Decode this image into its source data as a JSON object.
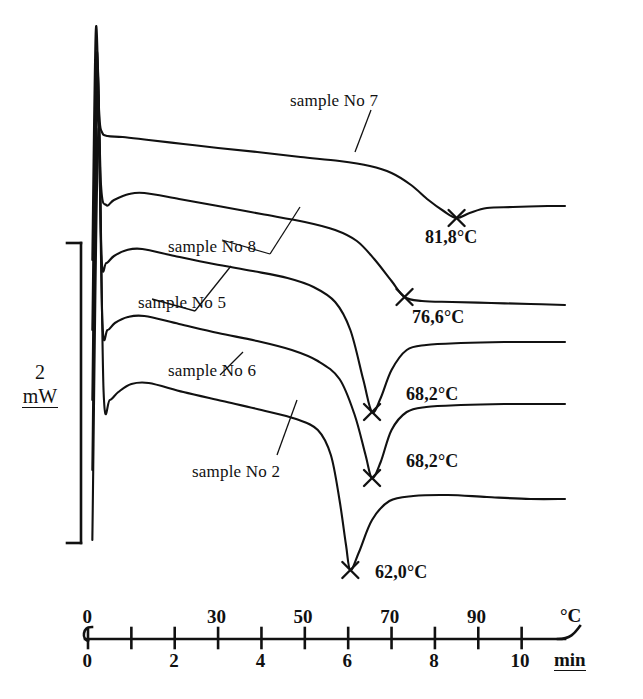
{
  "figure": {
    "type": "dsc-thermogram",
    "background_color": "#ffffff",
    "ink_color": "#111111"
  },
  "scale_bar": {
    "value": "2",
    "unit": "mW",
    "name": "2 mW vertical scale bar"
  },
  "axes": {
    "temperature_axis": {
      "unit_label": "°C",
      "tick_labels": [
        "0",
        "30",
        "50",
        "70",
        "90"
      ],
      "tick_values": [
        0,
        30,
        50,
        70,
        90
      ],
      "all_tick_values": [
        0,
        10,
        20,
        30,
        40,
        50,
        60,
        70,
        80,
        90,
        100
      ],
      "range": [
        0,
        100
      ]
    },
    "time_axis": {
      "unit_label": "min",
      "tick_labels": [
        "0",
        "2",
        "4",
        "6",
        "8",
        "10"
      ],
      "tick_values": [
        0,
        2,
        4,
        6,
        8,
        10
      ],
      "all_tick_values": [
        0,
        1,
        2,
        3,
        4,
        5,
        6,
        7,
        8,
        9,
        10
      ],
      "range": [
        0,
        11
      ]
    }
  },
  "curve_labels": [
    {
      "text": "sample No 7",
      "name": "curve-label-sample-no-7"
    },
    {
      "text": "sample No 8",
      "name": "curve-label-sample-no-8"
    },
    {
      "text": "sample No 5",
      "name": "curve-label-sample-no-5"
    },
    {
      "text": "sample No 6",
      "name": "curve-label-sample-no-6"
    },
    {
      "text": "sample No 2",
      "name": "curve-label-sample-no-2"
    }
  ],
  "peak_labels": [
    {
      "text": "81,8°C",
      "name": "peak-label-81-8"
    },
    {
      "text": "76,6°C",
      "name": "peak-label-76-6"
    },
    {
      "text": "68,2°C",
      "name": "peak-label-68-2-upper"
    },
    {
      "text": "68,2°C",
      "name": "peak-label-68-2-lower"
    },
    {
      "text": "62,0°C",
      "name": "peak-label-62-0"
    }
  ],
  "chart_data": {
    "type": "line",
    "title": "",
    "xlabel": "min",
    "ylabel": "mW",
    "x_secondary_label": "°C",
    "xlim": [
      0,
      11
    ],
    "x_temperature_lim": [
      0,
      100
    ],
    "grid": false,
    "legend": "inline-annotations",
    "scale_bar_mW": 2,
    "x_ticks_min": [
      0,
      1,
      2,
      3,
      4,
      5,
      6,
      7,
      8,
      9,
      10
    ],
    "x_ticklabels_min": [
      "0",
      "",
      "2",
      "",
      "4",
      "",
      "6",
      "",
      "8",
      "",
      "10"
    ],
    "x_ticks_degC": [
      0,
      10,
      20,
      30,
      40,
      50,
      60,
      70,
      80,
      90,
      100
    ],
    "x_ticklabels_degC": [
      "0",
      "",
      "",
      "30",
      "",
      "50",
      "",
      "70",
      "",
      "90",
      ""
    ],
    "series": [
      {
        "name": "sample No 7",
        "peak_temperature_C": 81.8,
        "peak_label": "81,8°C",
        "peak_time_min": 8.5,
        "peak_marker": "x",
        "points": [
          [
            0.1,
            260
          ],
          [
            0.18,
            30
          ],
          [
            0.26,
            115
          ],
          [
            0.32,
            132
          ],
          [
            0.45,
            136
          ],
          [
            0.8,
            137
          ],
          [
            1.4,
            140
          ],
          [
            2.2,
            144
          ],
          [
            3.0,
            148
          ],
          [
            3.9,
            152
          ],
          [
            4.9,
            157
          ],
          [
            5.8,
            161
          ],
          [
            6.5,
            166
          ],
          [
            7.0,
            173
          ],
          [
            7.45,
            185
          ],
          [
            7.85,
            200
          ],
          [
            8.2,
            211
          ],
          [
            8.5,
            218
          ],
          [
            8.8,
            213
          ],
          [
            9.2,
            208
          ],
          [
            9.8,
            207
          ],
          [
            10.6,
            206
          ],
          [
            11.0,
            206
          ]
        ]
      },
      {
        "name": "sample No 8",
        "peak_temperature_C": 76.6,
        "peak_label": "76,6°C",
        "peak_time_min": 7.3,
        "peak_marker": "x",
        "points": [
          [
            0.1,
            330
          ],
          [
            0.2,
            55
          ],
          [
            0.3,
            185
          ],
          [
            0.42,
            205
          ],
          [
            0.6,
            200
          ],
          [
            0.95,
            194
          ],
          [
            1.3,
            193
          ],
          [
            2.1,
            199
          ],
          [
            3.0,
            206
          ],
          [
            4.0,
            214
          ],
          [
            5.0,
            222
          ],
          [
            5.7,
            230
          ],
          [
            6.2,
            241
          ],
          [
            6.6,
            259
          ],
          [
            7.0,
            281
          ],
          [
            7.3,
            297
          ],
          [
            7.7,
            301
          ],
          [
            8.4,
            302
          ],
          [
            9.3,
            303
          ],
          [
            10.2,
            304
          ],
          [
            11.0,
            305
          ]
        ]
      },
      {
        "name": "sample No 5",
        "peak_temperature_C": 68.2,
        "peak_label": "68,2°C",
        "peak_time_min": 6.55,
        "peak_marker": "x",
        "points": [
          [
            0.1,
            400
          ],
          [
            0.21,
            70
          ],
          [
            0.31,
            255
          ],
          [
            0.42,
            263
          ],
          [
            0.6,
            256
          ],
          [
            0.9,
            250
          ],
          [
            1.25,
            249
          ],
          [
            2.0,
            256
          ],
          [
            2.9,
            264
          ],
          [
            3.8,
            271
          ],
          [
            4.6,
            278
          ],
          [
            5.2,
            287
          ],
          [
            5.7,
            302
          ],
          [
            6.05,
            330
          ],
          [
            6.35,
            380
          ],
          [
            6.55,
            412
          ],
          [
            6.75,
            398
          ],
          [
            7.0,
            370
          ],
          [
            7.35,
            350
          ],
          [
            7.8,
            345
          ],
          [
            8.6,
            343
          ],
          [
            9.6,
            342
          ],
          [
            10.6,
            342
          ],
          [
            11.0,
            342
          ]
        ]
      },
      {
        "name": "sample No 6",
        "peak_temperature_C": 68.2,
        "peak_label": "68,2°C",
        "peak_time_min": 6.55,
        "peak_marker": "x",
        "points": [
          [
            0.1,
            470
          ],
          [
            0.22,
            95
          ],
          [
            0.33,
            320
          ],
          [
            0.45,
            330
          ],
          [
            0.62,
            323
          ],
          [
            0.92,
            317
          ],
          [
            1.3,
            316
          ],
          [
            2.1,
            324
          ],
          [
            3.0,
            333
          ],
          [
            3.9,
            341
          ],
          [
            4.7,
            350
          ],
          [
            5.3,
            361
          ],
          [
            5.8,
            379
          ],
          [
            6.15,
            415
          ],
          [
            6.4,
            455
          ],
          [
            6.55,
            478
          ],
          [
            6.75,
            462
          ],
          [
            7.0,
            430
          ],
          [
            7.35,
            412
          ],
          [
            7.8,
            407
          ],
          [
            8.6,
            405
          ],
          [
            9.6,
            404
          ],
          [
            10.6,
            404
          ],
          [
            11.0,
            404
          ]
        ]
      },
      {
        "name": "sample No 2",
        "peak_temperature_C": 62.0,
        "peak_label": "62,0°C",
        "peak_time_min": 6.05,
        "peak_marker": "x",
        "points": [
          [
            0.1,
            540
          ],
          [
            0.24,
            130
          ],
          [
            0.36,
            392
          ],
          [
            0.5,
            400
          ],
          [
            0.7,
            392
          ],
          [
            1.0,
            384
          ],
          [
            1.4,
            383
          ],
          [
            2.2,
            392
          ],
          [
            3.1,
            401
          ],
          [
            4.0,
            410
          ],
          [
            4.8,
            419
          ],
          [
            5.3,
            430
          ],
          [
            5.6,
            455
          ],
          [
            5.8,
            500
          ],
          [
            5.95,
            545
          ],
          [
            6.05,
            570
          ],
          [
            6.25,
            552
          ],
          [
            6.55,
            520
          ],
          [
            6.95,
            501
          ],
          [
            7.5,
            496
          ],
          [
            8.3,
            495
          ],
          [
            9.2,
            497
          ],
          [
            10.2,
            499
          ],
          [
            11.0,
            499
          ]
        ]
      }
    ]
  }
}
